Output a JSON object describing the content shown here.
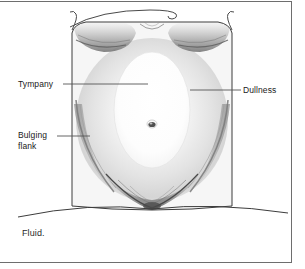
{
  "figure": {
    "caption": "Fluid.",
    "labels": [
      {
        "id": "tympany",
        "text": "Tympany"
      },
      {
        "id": "dullness",
        "text": "Dullness"
      },
      {
        "id": "bulging_flank",
        "line1": "Bulging",
        "line2": "flank"
      }
    ],
    "colors": {
      "outline": "#3c3c3c",
      "skin_fill": "#f4f4f4",
      "tympany_fill": "#fbfbfb",
      "dullness_shade": "#d9d9d9",
      "shadow": "#8c8c8c",
      "umbilicus": "#4a4a4a",
      "frame": "#6e6e6e",
      "text": "#1a1a1a",
      "leader_line": "#555555"
    },
    "parts": {
      "torso": "torso-outline",
      "breasts": "breast-underside-shading",
      "umbilicus": "umbilicus",
      "flank_left": "left-bulging-flank-shading",
      "flank_right": "right-bulging-flank-shading",
      "pubic_v": "inguinal-pubic-shading",
      "bed_line": "examination-table-line",
      "drape": "drape-curve"
    }
  }
}
